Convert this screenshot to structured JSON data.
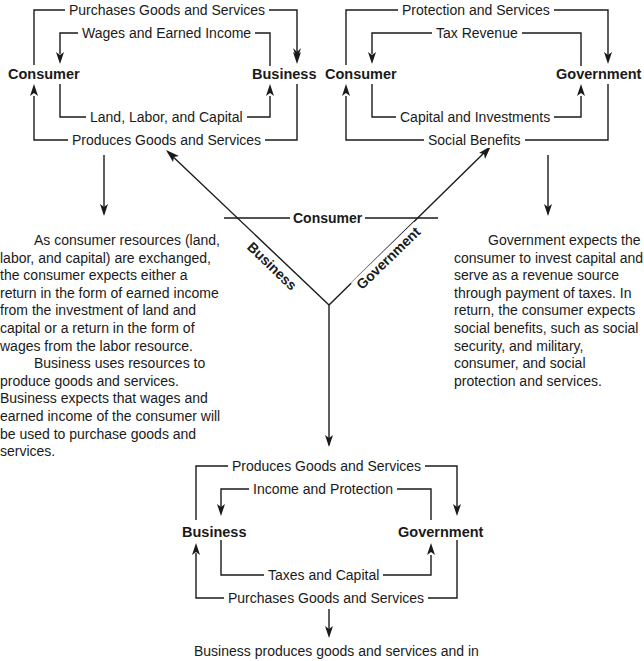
{
  "diagram": {
    "type": "circular-flow relationships",
    "cycles": [
      {
        "id": "consumer-business",
        "left_node": "Consumer",
        "right_node": "Business",
        "flows": [
          {
            "label": "Purchases Goods and Services",
            "from": "Consumer",
            "to": "Business",
            "position": "outer-top"
          },
          {
            "label": "Wages and Earned Income",
            "from": "Business",
            "to": "Consumer",
            "position": "inner-top"
          },
          {
            "label": "Land, Labor, and Capital",
            "from": "Consumer",
            "to": "Business",
            "position": "inner-bottom"
          },
          {
            "label": "Produces Goods and Services",
            "from": "Business",
            "to": "Consumer",
            "position": "outer-bottom"
          }
        ],
        "description": [
          "As consumer resources (land, labor, and capital) are exchanged, the consumer expects either a return in the form of earned income from the investment of land and capital or a return in the form of wages from the labor resource.",
          "Business uses resources to produce goods and services. Business expects that wages and earned income of the consumer will be used to purchase goods and services."
        ]
      },
      {
        "id": "consumer-government",
        "left_node": "Consumer",
        "right_node": "Government",
        "flows": [
          {
            "label": "Protection and Services",
            "from": "Consumer",
            "to": "Government",
            "position": "outer-top"
          },
          {
            "label": "Tax Revenue",
            "from": "Government",
            "to": "Consumer",
            "position": "inner-top"
          },
          {
            "label": "Capital and Investments",
            "from": "Consumer",
            "to": "Government",
            "position": "inner-bottom"
          },
          {
            "label": "Social Benefits",
            "from": "Government",
            "to": "Consumer",
            "position": "outer-bottom"
          }
        ],
        "description": [
          "Government expects the consumer to invest capital and serve as a revenue source through payment of taxes. In return, the consumer expects social benefits, such as social security, and military, consumer, and social protection and services."
        ]
      },
      {
        "id": "business-government",
        "left_node": "Business",
        "right_node": "Government",
        "flows": [
          {
            "label": "Produces Goods and Services",
            "from": "Business",
            "to": "Government",
            "position": "outer-top"
          },
          {
            "label": "Income and Protection",
            "from": "Government",
            "to": "Business",
            "position": "inner-top"
          },
          {
            "label": "Taxes and Capital",
            "from": "Business",
            "to": "Government",
            "position": "inner-bottom"
          },
          {
            "label": "Purchases Goods and Services",
            "from": "Government",
            "to": "Business",
            "position": "outer-bottom"
          }
        ],
        "description": [
          "Business produces goods and services and in"
        ]
      }
    ],
    "central_y": {
      "arm_consumer": "Consumer",
      "arm_business": "Business",
      "arm_government": "Government"
    }
  }
}
